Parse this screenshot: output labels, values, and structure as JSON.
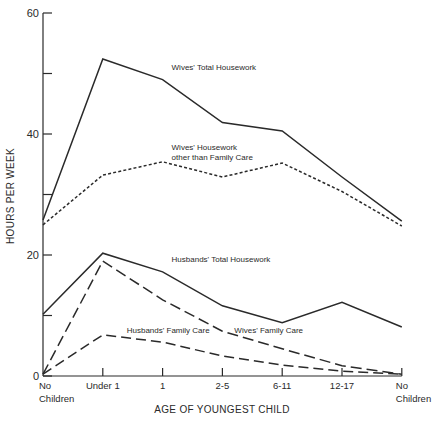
{
  "chart_data": {
    "type": "line",
    "title": "",
    "xlabel": "AGE OF YOUNGEST CHILD",
    "ylabel": "HOURS PER WEEK",
    "ylim": [
      0,
      60
    ],
    "yticks": [
      0,
      20,
      40,
      60
    ],
    "yticks_minor": [
      10,
      30,
      50
    ],
    "grid": false,
    "categories": [
      [
        "No",
        "Children"
      ],
      [
        "Under 1"
      ],
      [
        "1"
      ],
      [
        "2-5"
      ],
      [
        "6-11"
      ],
      [
        "12-17"
      ],
      [
        "No",
        "Children"
      ]
    ],
    "series": [
      {
        "name": "Wives' Total Housework",
        "style": "solid",
        "values": [
          25.8,
          52.4,
          49.0,
          41.9,
          40.5,
          32.9,
          25.6
        ],
        "label_lines": [
          "Wives' Total Housework"
        ],
        "label_at": {
          "x_index": 2.15,
          "y": 50.5
        }
      },
      {
        "name": "Wives' Housework other than Family Care",
        "style": "dotted",
        "values": [
          25.0,
          33.2,
          35.4,
          32.9,
          35.2,
          30.5,
          24.8
        ],
        "label_lines": [
          "Wives' Housework",
          "other than Family Care"
        ],
        "label_at": {
          "x_index": 2.15,
          "y": 37.3
        }
      },
      {
        "name": "Husbands' Total Housework",
        "style": "solid",
        "values": [
          10.2,
          20.3,
          17.2,
          11.6,
          8.8,
          12.2,
          8.1
        ],
        "label_lines": [
          "Husbands' Total Housework"
        ],
        "label_at": {
          "x_index": 2.15,
          "y": 18.8
        }
      },
      {
        "name": "Wives' Family Care",
        "style": "longdash",
        "values": [
          0.3,
          19.0,
          12.6,
          7.4,
          4.5,
          1.7,
          0.3
        ],
        "label_lines": [
          "Wives' Family Care"
        ],
        "label_at": {
          "x_index": 3.2,
          "y": 7.1
        }
      },
      {
        "name": "Husbands' Family Care",
        "style": "dash",
        "values": [
          0.3,
          6.8,
          5.6,
          3.3,
          1.8,
          0.8,
          0.3
        ],
        "label_lines": [
          "Husbands' Family Care"
        ],
        "label_at": {
          "x_index": 1.4,
          "y": 7.1
        }
      }
    ]
  }
}
